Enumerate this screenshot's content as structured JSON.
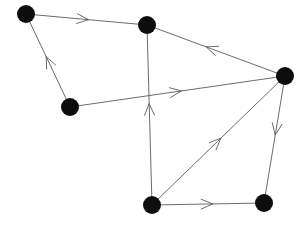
{
  "figure": {
    "background_color": "#ffffff",
    "node_color": "#0d0d0d",
    "edge_color": "#5b5b5b",
    "width": 302,
    "height": 227
  },
  "chart_data": {
    "type": "diagram",
    "diagram_type": "directed-graph",
    "title": "",
    "node_radius": 9,
    "nodes": [
      {
        "id": "n1",
        "label": "",
        "x": 26,
        "y": 14
      },
      {
        "id": "n2",
        "label": "",
        "x": 147,
        "y": 25
      },
      {
        "id": "n3",
        "label": "",
        "x": 70,
        "y": 107
      },
      {
        "id": "n4",
        "label": "",
        "x": 152,
        "y": 205
      },
      {
        "id": "n5",
        "label": "",
        "x": 285,
        "y": 76
      },
      {
        "id": "n6",
        "label": "",
        "x": 264,
        "y": 203
      }
    ],
    "edges": [
      {
        "from": "n1",
        "to": "n2",
        "directed": true,
        "arrow_at": 0.52
      },
      {
        "from": "n3",
        "to": "n1",
        "directed": true,
        "arrow_at": 0.55
      },
      {
        "from": "n5",
        "to": "n2",
        "directed": true,
        "arrow_at": 0.58
      },
      {
        "from": "n3",
        "to": "n5",
        "directed": true,
        "arrow_at": 0.52
      },
      {
        "from": "n4",
        "to": "n2",
        "directed": true,
        "arrow_at": 0.57
      },
      {
        "from": "n4",
        "to": "n5",
        "directed": true,
        "arrow_at": 0.52
      },
      {
        "from": "n5",
        "to": "n6",
        "directed": true,
        "arrow_at": 0.46
      },
      {
        "from": "n4",
        "to": "n6",
        "directed": true,
        "arrow_at": 0.55
      }
    ],
    "legend": [],
    "annotations": []
  }
}
